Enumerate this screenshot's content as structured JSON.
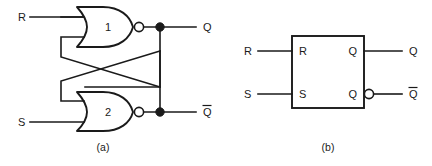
{
  "figure": {
    "background_color": "#ffffff",
    "ink_color": "#1a1a1a"
  },
  "panel_a": {
    "caption": "(a)",
    "inputs": [
      {
        "label": "R",
        "name": "reset"
      },
      {
        "label": "S",
        "name": "set"
      }
    ],
    "gates": [
      {
        "number": "1",
        "type": "NOR",
        "inverting_bubble": true
      },
      {
        "number": "2",
        "type": "NOR",
        "inverting_bubble": true
      }
    ],
    "outputs": [
      {
        "label": "Q",
        "overbar": false
      },
      {
        "label": "Q",
        "overbar": true
      }
    ],
    "junction_dots": 2,
    "cross_coupled": true
  },
  "panel_b": {
    "caption": "(b)",
    "block_label": "",
    "inputs": [
      {
        "outer_label": "R",
        "pin_label": "R"
      },
      {
        "outer_label": "S",
        "pin_label": "S"
      }
    ],
    "outputs": [
      {
        "outer_label": "Q",
        "pin_label": "Q",
        "overbar": false,
        "inverting_bubble": false
      },
      {
        "outer_label": "Q",
        "pin_label": "Q",
        "overbar": true,
        "inverting_bubble": true
      }
    ]
  }
}
